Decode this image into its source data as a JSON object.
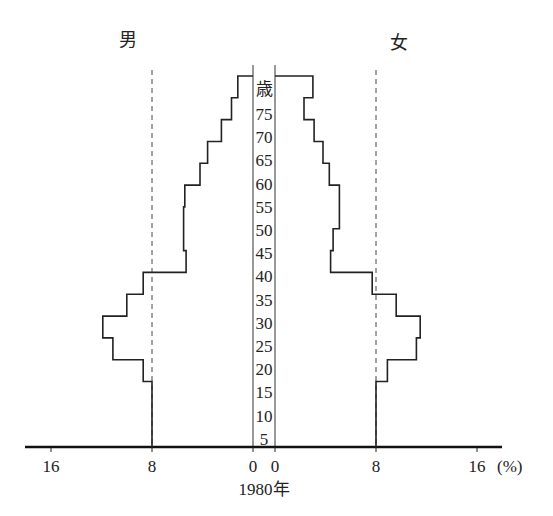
{
  "chart_data": {
    "type": "bar",
    "subtype": "population-pyramid",
    "title": "1980年",
    "year_label": "1980年",
    "left_label": "男",
    "right_label": "女",
    "age_unit_label": "歳",
    "x_unit": "(%)",
    "xlabel": "%",
    "ylabel": "歳",
    "xlim": [
      0,
      16
    ],
    "x_ticks_left": [
      "16",
      "8",
      "0"
    ],
    "x_ticks_right": [
      "0",
      "8",
      "16"
    ],
    "x_tick_unit_suffix": "(%)",
    "reference_line": 8,
    "age_tick_labels": [
      "75",
      "70",
      "65",
      "60",
      "55",
      "50",
      "45",
      "40",
      "35",
      "30",
      "25",
      "20",
      "15",
      "10",
      "5"
    ],
    "categories": [
      "0-4",
      "5-9",
      "10-14",
      "15-19",
      "20-24",
      "25-29",
      "30-34",
      "35-39",
      "40-44",
      "45-49",
      "50-54",
      "55-59",
      "60-64",
      "65-69",
      "70-74",
      "75-79",
      "80+"
    ],
    "series": [
      {
        "name": "男",
        "side": "left",
        "values": [
          8.0,
          8.0,
          8.0,
          8.7,
          11.1,
          11.9,
          10.0,
          8.7,
          5.3,
          5.5,
          5.5,
          5.4,
          4.2,
          3.6,
          2.5,
          1.7,
          1.2
        ]
      },
      {
        "name": "女",
        "side": "right",
        "values": [
          8.0,
          8.0,
          8.0,
          8.9,
          11.2,
          11.5,
          9.6,
          7.7,
          4.4,
          4.6,
          5.1,
          5.1,
          4.3,
          3.8,
          3.1,
          2.3,
          3.0
        ]
      }
    ],
    "grid": false,
    "legend": "none"
  }
}
